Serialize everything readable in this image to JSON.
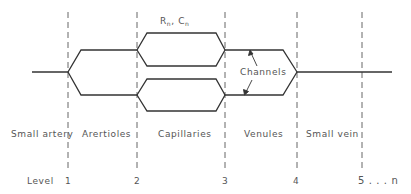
{
  "diagram": {
    "type": "vascular-branching-schematic",
    "annotation": {
      "resistance_symbol": "R",
      "capacitance_symbol": "C",
      "subscript": "n",
      "separator": ",",
      "channels_label": "Channels"
    },
    "segments": [
      {
        "label": "Small artery"
      },
      {
        "label": "Arertioles"
      },
      {
        "label": "Capillaries"
      },
      {
        "label": "Venules"
      },
      {
        "label": "Small vein"
      }
    ],
    "level_title": "Level",
    "levels": [
      "1",
      "2",
      "3",
      "4",
      "5 . . . n"
    ],
    "colors": {
      "line": "#333333",
      "dashed": "#666666",
      "text": "#555555"
    }
  }
}
